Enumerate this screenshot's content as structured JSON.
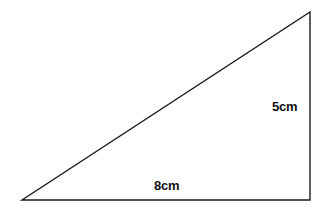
{
  "figure": {
    "background_color": "#ffffff",
    "stroke_color": "#1a1a1a",
    "stroke_width": 1.4,
    "text_color": "#111111"
  },
  "shape": {
    "type": "right-triangle",
    "vertices": [
      {
        "name": "bottom-left",
        "x": 22,
        "y": 200
      },
      {
        "name": "bottom-right",
        "x": 310,
        "y": 200
      },
      {
        "name": "top-right",
        "x": 310,
        "y": 12
      }
    ],
    "right_angle_at": "bottom-right"
  },
  "labels": {
    "vertical_side": "5cm",
    "base_side": "8cm"
  },
  "chart_data": {
    "type": "diagram",
    "sides": [
      {
        "name": "base",
        "label": "8cm",
        "value": 8,
        "unit": "cm",
        "orientation": "horizontal"
      },
      {
        "name": "height",
        "label": "5cm",
        "value": 5,
        "unit": "cm",
        "orientation": "vertical"
      },
      {
        "name": "hypotenuse",
        "label": "",
        "value": null,
        "unit": "cm",
        "orientation": "diagonal"
      }
    ]
  }
}
